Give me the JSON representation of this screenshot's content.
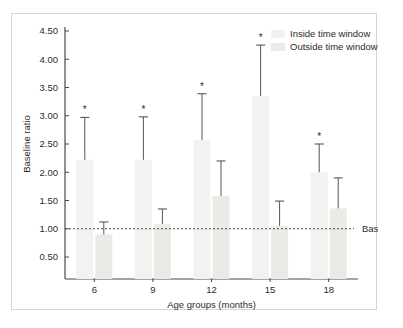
{
  "figure": {
    "background_color": "#ffffff",
    "frame_color": "#d6d6d6",
    "axis_color": "#4a4a4a",
    "bar_inside_color": "#f2f2f0",
    "bar_outside_color": "#eceae6",
    "error_bar_color": "#555555",
    "baseline_color": "#444444",
    "text_color": "#2b2b2b"
  },
  "chart_data": {
    "type": "bar",
    "title": "",
    "subtitle": "",
    "xlabel": "Age groups (months)",
    "ylabel": "Baseline ratio",
    "categories": [
      "6",
      "9",
      "12",
      "15",
      "18"
    ],
    "ylim": [
      0.0,
      4.7
    ],
    "yticks": [
      0.5,
      1.0,
      1.5,
      2.0,
      2.5,
      3.0,
      3.5,
      4.0,
      4.5
    ],
    "ytick_labels": [
      "0.50",
      "1.00",
      "1.50",
      "2.00",
      "2.50",
      "3.00",
      "3.50",
      "4.00",
      "4.50"
    ],
    "grid": false,
    "legend_position": "top-right",
    "legend": [
      "Inside time window",
      "Outside time window"
    ],
    "series": [
      {
        "name": "Inside time window",
        "values": [
          2.22,
          2.22,
          2.57,
          3.35,
          2.0
        ],
        "error_upper": [
          2.97,
          2.98,
          3.39,
          4.25,
          2.5
        ],
        "significance": [
          "*",
          "*",
          "*",
          "*",
          "*"
        ]
      },
      {
        "name": "Outside time window",
        "values": [
          0.9,
          1.08,
          1.58,
          1.05,
          1.36
        ],
        "error_upper": [
          1.12,
          1.35,
          2.2,
          1.49,
          1.9
        ],
        "significance": [
          "",
          "",
          "",
          "",
          ""
        ]
      }
    ],
    "annotations": [
      {
        "label": "Baseline",
        "value": 1.0,
        "style": "dashed-horizontal-line"
      }
    ]
  }
}
